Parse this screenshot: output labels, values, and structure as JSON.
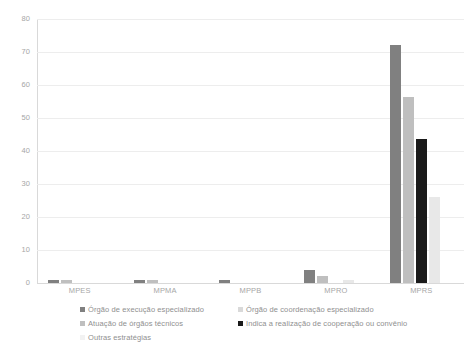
{
  "chart_data": {
    "type": "bar",
    "title": "",
    "subtitle": "",
    "xlabel": "",
    "ylabel": "",
    "categories": [
      "MPES",
      "MPMA",
      "MPPB",
      "MPRO",
      "MPRS"
    ],
    "ylim": [
      0,
      80
    ],
    "yticks": [
      0,
      10,
      20,
      30,
      40,
      50,
      60,
      70,
      80
    ],
    "ytick_labels": [
      "0",
      "10",
      "20",
      "30",
      "40",
      "50",
      "60",
      "70",
      "80"
    ],
    "grid": true,
    "legend_position": "bottom",
    "series": [
      {
        "name": "Órgão de execução especializado",
        "color": "#808080",
        "values": [
          1,
          1,
          1,
          4,
          72
        ]
      },
      {
        "name": "Órgão de coordenação especializado",
        "color": "#bfbfbf",
        "values": [
          1,
          1,
          0,
          2,
          56.5
        ]
      },
      {
        "name": "Atuação de órgãos técnicos",
        "color": "#1a1a1a",
        "values": [
          0,
          0,
          0,
          0,
          43.7
        ]
      },
      {
        "name": "Indica a realização de cooperação ou convênio",
        "color": "#e8e8e8",
        "values": [
          0,
          0,
          0,
          1,
          26
        ]
      },
      {
        "name": "Outras estratégias",
        "color": "#f2f2f2",
        "values": [
          0,
          0,
          0,
          0,
          0
        ]
      }
    ]
  },
  "legend": {
    "left_column": [
      {
        "label": "Órgão de execução especializado",
        "color": "#808080"
      },
      {
        "label": "Atuação de órgãos técnicos",
        "color": "#bfbfbf"
      },
      {
        "label": "Outras estratégias",
        "color": "#f2f2f2"
      }
    ],
    "right_column": [
      {
        "label": "Órgão de coordenação especializado",
        "color": "#d9d9d9"
      },
      {
        "label": "Indica a realização de cooperação ou convênio",
        "color": "#1a1a1a"
      }
    ]
  },
  "axis": {
    "y_max": 80,
    "y_min": 0,
    "y_step": 10
  }
}
